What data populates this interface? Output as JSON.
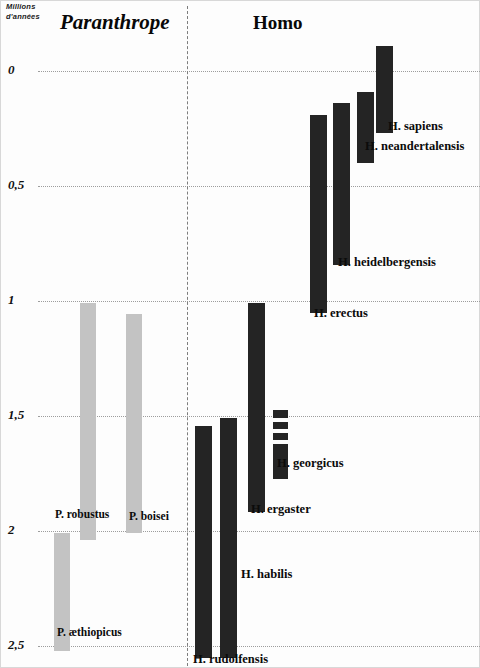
{
  "figure": {
    "axis_caption_line1": "Millions",
    "axis_caption_line2": "d'années",
    "group_left": "Paranthrope",
    "group_right": "Homo"
  },
  "chart_data": {
    "type": "bar",
    "orientation": "vertical-range",
    "title": "",
    "subtitle": "",
    "xlabel": "",
    "ylabel": "Millions d'années",
    "ylim": [
      0,
      2.5
    ],
    "y_inverted": true,
    "grid": true,
    "legend": "none",
    "ytick_labels": [
      "0",
      "0,5",
      "1",
      "1,5",
      "2",
      "2,5"
    ],
    "ytick_values": [
      0,
      0.5,
      1,
      1.5,
      2,
      2.5
    ],
    "groups": [
      {
        "name": "Paranthrope",
        "color": "#c3c3c3"
      },
      {
        "name": "Homo",
        "color": "#242424"
      }
    ],
    "series": [
      {
        "name": "P. robustus",
        "group": "Paranthrope",
        "color": "#c3c3c3",
        "start_ma": 1.0,
        "end_ma": 2.35,
        "px": {
          "left": 80,
          "width": 16,
          "top": 303,
          "height": 237
        },
        "label": "P. robustus",
        "label_px": {
          "left": 55,
          "top": 508
        }
      },
      {
        "name": "P. boisei",
        "group": "Paranthrope",
        "color": "#c3c3c3",
        "start_ma": 1.05,
        "end_ma": 2.0,
        "px": {
          "left": 126,
          "width": 16,
          "top": 314,
          "height": 219
        },
        "label": "P. boisei",
        "label_px": {
          "left": 129,
          "top": 510
        }
      },
      {
        "name": "P. aethiopicus",
        "group": "Paranthrope",
        "color": "#c3c3c3",
        "start_ma": 2.0,
        "end_ma": 2.5,
        "px": {
          "left": 54,
          "width": 16,
          "top": 533,
          "height": 118
        },
        "label": "P. æthiopicus",
        "label_px": {
          "left": 57,
          "top": 626
        }
      },
      {
        "name": "H. sapiens",
        "group": "Homo",
        "color": "#242424",
        "start_ma": -0.11,
        "end_ma": 0.27,
        "px": {
          "left": 376,
          "width": 17,
          "top": 46,
          "height": 87
        },
        "label": "H. sapiens",
        "label_px": {
          "left": 388,
          "top": 119
        }
      },
      {
        "name": "H. neandertalensis",
        "group": "Homo",
        "color": "#242424",
        "start_ma": 0.09,
        "end_ma": 0.4,
        "px": {
          "left": 357,
          "width": 17,
          "top": 92,
          "height": 71
        },
        "label": "H. neandertalensis",
        "label_px": {
          "left": 365,
          "top": 139
        }
      },
      {
        "name": "H. heidelbergensis",
        "group": "Homo",
        "color": "#242424",
        "start_ma": 0.14,
        "end_ma": 0.85,
        "px": {
          "left": 333,
          "width": 17,
          "top": 103,
          "height": 162
        },
        "label": "H. heidelbergensis",
        "label_px": {
          "left": 338,
          "top": 255
        }
      },
      {
        "name": "H. erectus",
        "group": "Homo",
        "color": "#242424",
        "start_ma": 0.19,
        "end_ma": 1.06,
        "px": {
          "left": 310,
          "width": 17,
          "top": 115,
          "height": 198
        },
        "label": "H. erectus",
        "label_px": {
          "left": 314,
          "top": 306
        }
      },
      {
        "name": "H. ergaster",
        "group": "Homo",
        "color": "#242424",
        "start_ma": 1.0,
        "end_ma": 1.92,
        "px": {
          "left": 248,
          "width": 17,
          "top": 303,
          "height": 209
        },
        "label": "H. ergaster",
        "label_px": {
          "left": 251,
          "top": 502
        }
      },
      {
        "name": "H. georgicus",
        "group": "Homo",
        "color": "#242424",
        "start_ma": 1.48,
        "end_ma": 1.78,
        "segmented": true,
        "segments_px": [
          {
            "left": 273,
            "width": 15,
            "top": 410,
            "height": 8
          },
          {
            "left": 273,
            "width": 15,
            "top": 422,
            "height": 7
          },
          {
            "left": 273,
            "width": 15,
            "top": 433,
            "height": 7
          },
          {
            "left": 273,
            "width": 15,
            "top": 444,
            "height": 35
          }
        ],
        "label": "H. georgicus",
        "label_px": {
          "left": 277,
          "top": 456
        }
      },
      {
        "name": "H. habilis",
        "group": "Homo",
        "color": "#242424",
        "start_ma": 1.54,
        "end_ma": 2.5,
        "px": {
          "left": 220,
          "width": 17,
          "top": 418,
          "height": 240
        },
        "label": "H. habilis",
        "label_px": {
          "left": 241,
          "top": 567
        }
      },
      {
        "name": "H. rudolfensis",
        "group": "Homo",
        "color": "#242424",
        "start_ma": 1.56,
        "end_ma": 2.5,
        "px": {
          "left": 195,
          "width": 17,
          "top": 426,
          "height": 232
        },
        "label": "H. rudolfensis",
        "label_px": {
          "left": 193,
          "top": 652
        }
      }
    ],
    "gridlines_px_y": [
      71,
      186,
      301,
      416,
      531,
      646
    ]
  }
}
